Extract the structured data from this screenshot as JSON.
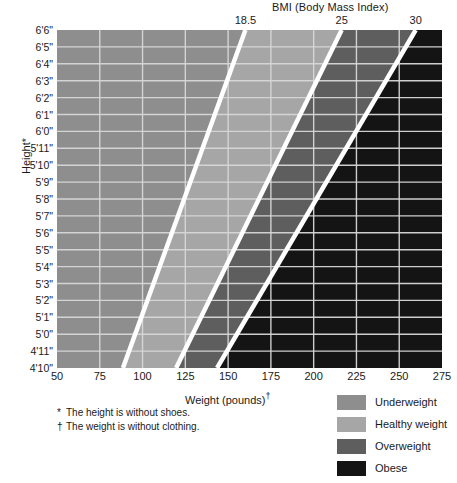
{
  "chart_data": {
    "type": "heatmap",
    "title": "BMI (Body Mass Index)",
    "xlabel": "Weight (pounds)",
    "xlabel_mark": "†",
    "ylabel": "Height",
    "ylabel_mark": "*",
    "xlim": [
      50,
      275
    ],
    "ylim_inches": [
      58,
      78
    ],
    "grid": true,
    "legend_position": "bottom-right",
    "x_ticks": [
      50,
      75,
      100,
      125,
      150,
      175,
      200,
      225,
      250,
      275
    ],
    "x_tick_labels": [
      "50",
      "75",
      "100",
      "125",
      "150",
      "175",
      "200",
      "225",
      "250",
      "275"
    ],
    "y_ticks_inches": [
      78,
      77,
      76,
      75,
      74,
      73,
      72,
      71,
      70,
      69,
      68,
      67,
      66,
      65,
      64,
      63,
      62,
      61,
      60,
      59,
      58
    ],
    "y_tick_labels": [
      "6'6\"",
      "6'5\"",
      "6'4\"",
      "6'3\"",
      "6'2\"",
      "6'1\"",
      "6'0\"",
      "5'11\"",
      "5'10\"",
      "5'9\"",
      "5'8\"",
      "5'7\"",
      "5'6\"",
      "5'5\"",
      "5'4\"",
      "5'3\"",
      "5'2\"",
      "5'1\"",
      "5'0\"",
      "4'11\"",
      "4'10\""
    ],
    "bmi_boundaries": [
      18.5,
      25,
      30
    ],
    "bmi_boundary_labels": [
      "18.5",
      "25",
      "30"
    ],
    "bands": [
      {
        "name": "Underweight",
        "bmi_max": 18.5,
        "color": "#8e8e8e"
      },
      {
        "name": "Healthy weight",
        "bmi_min": 18.5,
        "bmi_max": 25,
        "color": "#a6a6a6"
      },
      {
        "name": "Overweight",
        "bmi_min": 25,
        "bmi_max": 30,
        "color": "#5e5e5e"
      },
      {
        "name": "Obese",
        "bmi_min": 30,
        "color": "#141414"
      }
    ],
    "boundary_line_color": "#ffffff",
    "grid_color": "#d8d8d8",
    "annotations": [
      "* The height is without shoes.",
      "† The weight is without clothing."
    ]
  },
  "title": {
    "text": "BMI (Body Mass Index)"
  },
  "axes": {
    "y": {
      "label": "Height*"
    },
    "x": {
      "label": "Weight (pounds)",
      "mark": "†"
    }
  },
  "footnotes": [
    {
      "mark": "*",
      "text": "The height is without shoes."
    },
    {
      "mark": "†",
      "text": "The weight is without clothing."
    }
  ],
  "legend": {
    "items": [
      {
        "label": "Underweight",
        "color": "#8e8e8e"
      },
      {
        "label": "Healthy weight",
        "color": "#a6a6a6"
      },
      {
        "label": "Overweight",
        "color": "#5e5e5e"
      },
      {
        "label": "Obese",
        "color": "#141414"
      }
    ]
  }
}
